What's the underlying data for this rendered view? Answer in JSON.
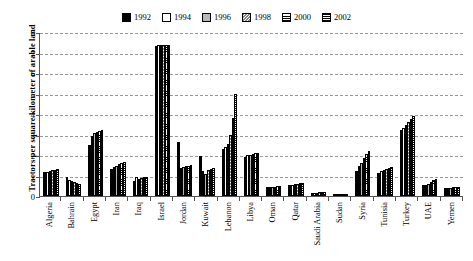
{
  "chart_data": {
    "type": "bar",
    "title": "",
    "xlabel": "",
    "ylabel": "Tractors per square kilometer of arable land",
    "ylim": [
      0,
      8
    ],
    "yticks": [
      "0",
      "1",
      "2",
      "3",
      "4",
      "5",
      "6",
      "7",
      "8"
    ],
    "grid": true,
    "legend_position": "top-center",
    "categories": [
      "Algeria",
      "Bahrain",
      "Egypt",
      "Iran",
      "Iraq",
      "Israel",
      "Jordan",
      "Kuwait",
      "Lebanon",
      "Libya",
      "Oman",
      "Qatar",
      "Saudi Arabia",
      "Sudan",
      "Syria",
      "Tunisia",
      "Turkey",
      "UAE",
      "Yemen"
    ],
    "series": [
      {
        "name": "1992",
        "pattern": "solid-black",
        "values": [
          1.15,
          0.92,
          2.5,
          1.3,
          0.72,
          7.3,
          2.62,
          1.95,
          2.3,
          1.92,
          0.42,
          0.52,
          0.15,
          0.05,
          1.2,
          1.12,
          3.22,
          0.52,
          0.38
        ]
      },
      {
        "name": "1994",
        "pattern": "white",
        "values": [
          1.18,
          0.8,
          2.95,
          1.42,
          0.95,
          7.35,
          1.35,
          1.22,
          2.38,
          1.98,
          0.45,
          0.55,
          0.16,
          0.05,
          1.45,
          1.22,
          3.3,
          0.55,
          0.4
        ]
      },
      {
        "name": "1996",
        "pattern": "gray",
        "values": [
          1.22,
          0.75,
          3.05,
          1.48,
          0.82,
          7.35,
          1.42,
          1.08,
          2.55,
          2.02,
          0.45,
          0.58,
          0.17,
          0.05,
          1.62,
          1.28,
          3.45,
          0.6,
          0.4
        ]
      },
      {
        "name": "1998",
        "pattern": "diagonal-hatch",
        "values": [
          1.25,
          0.68,
          3.12,
          1.55,
          0.88,
          7.35,
          1.45,
          1.28,
          2.98,
          2.05,
          0.46,
          0.6,
          0.18,
          0.06,
          1.85,
          1.32,
          3.6,
          0.7,
          0.42
        ]
      },
      {
        "name": "2000",
        "pattern": "horizontal-lines",
        "values": [
          1.28,
          0.62,
          3.18,
          1.62,
          0.92,
          7.35,
          1.48,
          1.32,
          3.8,
          2.08,
          0.48,
          0.62,
          0.19,
          0.06,
          2.05,
          1.38,
          3.78,
          0.78,
          0.42
        ]
      },
      {
        "name": "2002",
        "pattern": "cross-hatch-dense",
        "values": [
          1.32,
          0.58,
          3.22,
          1.68,
          0.95,
          7.38,
          1.5,
          1.38,
          5.0,
          2.1,
          0.5,
          0.62,
          0.2,
          0.06,
          2.2,
          1.42,
          3.88,
          0.82,
          0.42
        ]
      }
    ]
  }
}
